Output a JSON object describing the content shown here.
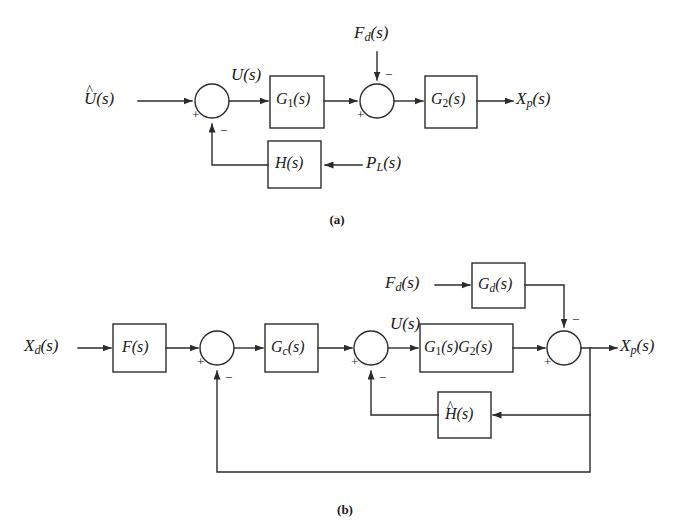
{
  "figure": {
    "background_color": "#ffffff",
    "line_color": "#2b2b2b",
    "captions": {
      "a": "(a)",
      "b": "(b)"
    }
  },
  "diagram_a": {
    "caption": "(a)",
    "input_label": "Û(s)",
    "input_base": "U",
    "input_paren": "(s)",
    "signal_u": "U(s)",
    "disturbance_label": "F",
    "disturbance_sub": "d",
    "disturbance_paren": "(s)",
    "output_label": "X",
    "output_sub": "p",
    "output_paren": "(s)",
    "secondary_input_label": "P",
    "secondary_input_sub": "L",
    "secondary_input_paren": "(s)",
    "blocks": [
      {
        "name": "G1",
        "base": "G",
        "sub": "1",
        "paren": "(s)"
      },
      {
        "name": "G2",
        "base": "G",
        "sub": "2",
        "paren": "(s)"
      },
      {
        "name": "H",
        "base": "H",
        "sub": "",
        "paren": "(s)"
      }
    ],
    "summing_junctions": [
      {
        "name": "sum-1",
        "signs": [
          "+",
          "−"
        ]
      },
      {
        "name": "sum-2",
        "signs": [
          "+",
          "−"
        ]
      }
    ],
    "signs": {
      "sum1_left": "+",
      "sum1_bottom": "−",
      "sum2_left": "+",
      "sum2_top": "−"
    }
  },
  "diagram_b": {
    "caption": "(b)",
    "input_label": "X",
    "input_sub": "d",
    "input_paren": "(s)",
    "signal_u": "U(s)",
    "disturbance_label": "F",
    "disturbance_sub": "d",
    "disturbance_paren": "(s)",
    "output_label": "X",
    "output_sub": "p",
    "output_paren": "(s)",
    "blocks": [
      {
        "name": "F",
        "base": "F",
        "sub": "",
        "paren": "(s)"
      },
      {
        "name": "Gc",
        "base": "G",
        "sub": "c",
        "paren": "(s)"
      },
      {
        "name": "G1G2",
        "base": "G",
        "sub": "1",
        "paren": "(s)",
        "base2": "G",
        "sub2": "2",
        "paren2": "(s)"
      },
      {
        "name": "Gd",
        "base": "G",
        "sub": "d",
        "paren": "(s)"
      },
      {
        "name": "Hhat",
        "base": "H",
        "sub": "",
        "paren": "(s)",
        "hat": true
      }
    ],
    "summing_junctions": [
      {
        "name": "sum-1",
        "signs": [
          "+",
          "−"
        ]
      },
      {
        "name": "sum-2",
        "signs": [
          "+",
          "−"
        ]
      },
      {
        "name": "sum-3",
        "signs": [
          "+",
          "−"
        ]
      }
    ],
    "signs": {
      "sum1_left": "+",
      "sum1_bottom": "−",
      "sum2_left": "+",
      "sum2_bottom": "−",
      "sum3_left": "+",
      "sum3_top": "−"
    }
  }
}
